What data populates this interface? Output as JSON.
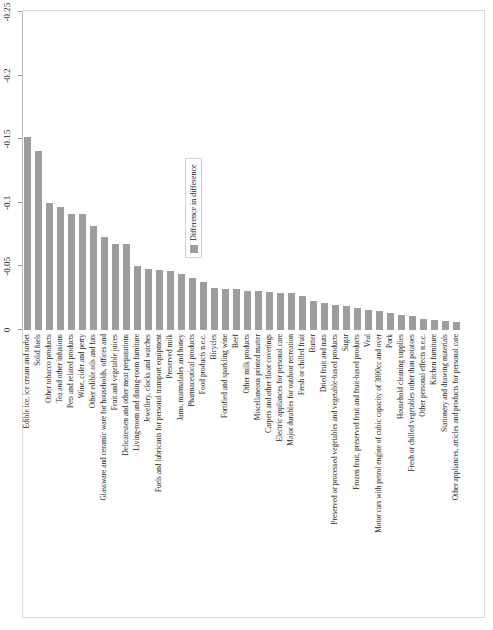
{
  "chart_data": {
    "type": "bar",
    "orientation": "horizontal",
    "title": "",
    "subtitle": "",
    "xlabel": "",
    "ylabel": "",
    "xlim": [
      -0.25,
      0
    ],
    "grid": false,
    "legend_position": "inside-right",
    "legend": [
      "Difference in difference"
    ],
    "axis_ticks": [
      "0",
      "-0.05",
      "-0.1",
      "-0.15",
      "-0.2",
      "-0.25"
    ],
    "axis_tick_values": [
      0,
      -0.05,
      -0.1,
      -0.15,
      -0.2,
      -0.25
    ],
    "series_name": "Difference in difference",
    "bar_color": "#9d9d9d",
    "categories": [
      "Edible ice, ice cream and sorbet",
      "Solid fuels",
      "Other tobacco products",
      "Tea and other infusions",
      "Pets and related products",
      "Wine, cider and perry",
      "Other edible oils and fats",
      "Glassware and ceramic ware for households, offices and",
      "Fruit and vegetable juices",
      "Delicatessen and other meat preparations",
      "Living-room and dining-room furniture",
      "Jewellery, clocks and watches",
      "Fuels and lubricants for personal transport equipment",
      "Preserved milk",
      "Jams, marmalades and honey",
      "Pharmaceutical products",
      "Food products n.e.c.",
      "Bicycles",
      "Fortified and sparkling wine",
      "Beef",
      "Other milk products",
      "Miscellaneous printed matter",
      "Carpets and other floor coverings",
      "Electric appliances for personal care",
      "Major durables for outdoor recreation",
      "Fresh or chilled fruit",
      "Butter",
      "Dried fruit and nuts",
      "Preserved or processed vegetables and vegetable-based products",
      "Sugar",
      "Frozen fruit, preserved fruit and fruit-based products",
      "Veal",
      "Motor cars with petrol engine of cubic capacity of 3000cc and over",
      "Pork",
      "Household cleaning supplies",
      "Fresh or chilled vegetables other than potatoes",
      "Other personal effects n.e.c.",
      "Kitchen furniture",
      "Stationery and drawing materials",
      "Other appliances, articles and products for personal care"
    ],
    "values": [
      -0.152,
      -0.141,
      -0.1,
      -0.097,
      -0.091,
      -0.091,
      -0.082,
      -0.073,
      -0.068,
      -0.068,
      -0.05,
      -0.048,
      -0.047,
      -0.046,
      -0.044,
      -0.041,
      -0.038,
      -0.033,
      -0.032,
      -0.032,
      -0.031,
      -0.031,
      -0.03,
      -0.029,
      -0.029,
      -0.027,
      -0.023,
      -0.021,
      -0.02,
      -0.019,
      -0.017,
      -0.016,
      -0.015,
      -0.013,
      -0.012,
      -0.011,
      -0.009,
      -0.008,
      -0.007,
      -0.006
    ]
  }
}
